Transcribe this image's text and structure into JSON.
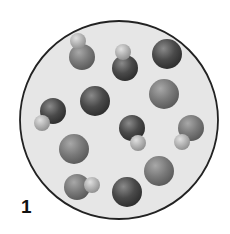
{
  "figure": {
    "panel_label": "1",
    "container": {
      "shape": "circle",
      "cx": 119,
      "cy": 120,
      "r": 99,
      "fill": "#e6e6e6",
      "stroke": "#222222"
    },
    "colors": {
      "dark": "#4a4a4a",
      "medium": "#7a7a7a",
      "light": "#b3b3b3"
    },
    "particles": [
      {
        "type": "diatomic",
        "atoms": [
          {
            "cx": 82,
            "cy": 57,
            "r": 13,
            "shade": "medium"
          },
          {
            "cx": 78,
            "cy": 41,
            "r": 8,
            "shade": "light"
          }
        ]
      },
      {
        "type": "diatomic",
        "atoms": [
          {
            "cx": 125,
            "cy": 68,
            "r": 13,
            "shade": "dark"
          },
          {
            "cx": 123,
            "cy": 52,
            "r": 8,
            "shade": "light"
          }
        ]
      },
      {
        "type": "atom",
        "atoms": [
          {
            "cx": 167,
            "cy": 54,
            "r": 15,
            "shade": "dark"
          }
        ]
      },
      {
        "type": "atom",
        "atoms": [
          {
            "cx": 95,
            "cy": 101,
            "r": 15,
            "shade": "dark"
          }
        ]
      },
      {
        "type": "atom",
        "atoms": [
          {
            "cx": 164,
            "cy": 94,
            "r": 15,
            "shade": "medium"
          }
        ]
      },
      {
        "type": "diatomic",
        "atoms": [
          {
            "cx": 53,
            "cy": 111,
            "r": 13,
            "shade": "dark"
          },
          {
            "cx": 42,
            "cy": 123,
            "r": 8,
            "shade": "light"
          }
        ]
      },
      {
        "type": "diatomic",
        "atoms": [
          {
            "cx": 132,
            "cy": 128,
            "r": 13,
            "shade": "dark"
          },
          {
            "cx": 138,
            "cy": 143,
            "r": 8,
            "shade": "light"
          }
        ]
      },
      {
        "type": "diatomic",
        "atoms": [
          {
            "cx": 191,
            "cy": 128,
            "r": 13,
            "shade": "medium"
          },
          {
            "cx": 182,
            "cy": 142,
            "r": 8,
            "shade": "light"
          }
        ]
      },
      {
        "type": "atom",
        "atoms": [
          {
            "cx": 74,
            "cy": 149,
            "r": 15,
            "shade": "medium"
          }
        ]
      },
      {
        "type": "diatomic",
        "atoms": [
          {
            "cx": 77,
            "cy": 187,
            "r": 13,
            "shade": "medium"
          },
          {
            "cx": 92,
            "cy": 185,
            "r": 8,
            "shade": "light"
          }
        ]
      },
      {
        "type": "atom",
        "atoms": [
          {
            "cx": 127,
            "cy": 192,
            "r": 15,
            "shade": "dark"
          }
        ]
      },
      {
        "type": "atom",
        "atoms": [
          {
            "cx": 159,
            "cy": 171,
            "r": 15,
            "shade": "medium"
          }
        ]
      }
    ]
  }
}
